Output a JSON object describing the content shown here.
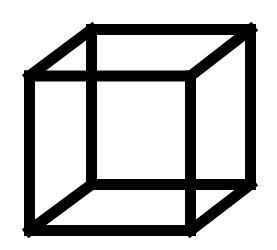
{
  "figure": {
    "style": "wireframe",
    "background_color": "#ffffff",
    "stroke_color": "#000000",
    "stroke_width": 11,
    "front_face": {
      "top_left": [
        29.5,
        76
      ],
      "top_right": [
        190.5,
        76
      ],
      "bottom_right": [
        190.5,
        230.5
      ],
      "bottom_left": [
        29.5,
        230.5
      ]
    },
    "back_face": {
      "top_left": [
        91.5,
        29.5
      ],
      "top_right": [
        250.5,
        29.5
      ],
      "bottom_right": [
        250.5,
        184.5
      ],
      "bottom_left": [
        91.5,
        184.5
      ]
    }
  }
}
